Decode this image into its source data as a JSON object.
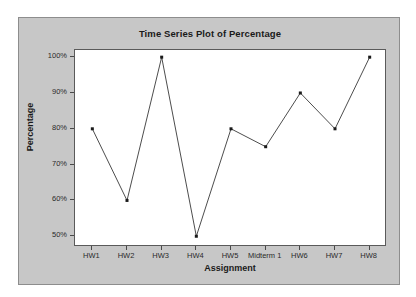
{
  "chart_data": {
    "type": "line",
    "title": "Time Series Plot of Percentage",
    "xlabel": "Assignment",
    "ylabel": "Percentage",
    "categories": [
      "HW1",
      "HW2",
      "HW3",
      "HW4",
      "HW5",
      "Midterm 1",
      "HW6",
      "HW7",
      "HW8"
    ],
    "values": [
      80,
      60,
      100,
      50,
      80,
      75,
      90,
      80,
      100
    ],
    "series": [
      {
        "name": "Percentage",
        "values": [
          80,
          60,
          100,
          50,
          80,
          75,
          90,
          80,
          100
        ]
      }
    ],
    "ylim": [
      47,
      102
    ],
    "yticks": [
      50,
      60,
      70,
      80,
      90,
      100
    ],
    "ytick_labels": [
      "50%",
      "60%",
      "70%",
      "80%",
      "90%",
      "100%"
    ],
    "grid": false,
    "legend": "none",
    "marker": "square",
    "line_color": "#4d4d4d",
    "marker_color": "#1a1a1a",
    "plot_background": "#ffffff",
    "figure_background": "#c7c7c7"
  }
}
